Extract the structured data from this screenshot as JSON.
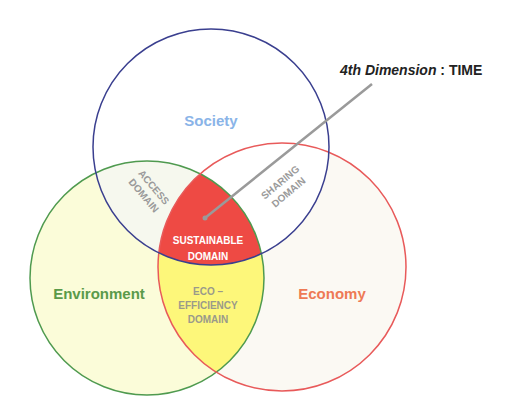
{
  "diagram": {
    "annotation": {
      "prefix": "4th Dimension",
      "separator": " : ",
      "value": "TIME"
    },
    "circles": [
      {
        "id": "society",
        "label": "Society",
        "stroke": "#3a3f8f",
        "fill": "#ffffff",
        "label_color": "#8ab4e8"
      },
      {
        "id": "environment",
        "label": "Environment",
        "stroke": "#4f9a4f",
        "fill": "#fbfcd9",
        "label_color": "#5a9a4a"
      },
      {
        "id": "economy",
        "label": "Economy",
        "stroke": "#e85a5a",
        "fill": "#fbf9f3",
        "label_color": "#ee7a55"
      }
    ],
    "intersections": {
      "access": {
        "line1": "ACCESS",
        "line2": "DOMAIN",
        "color": "#9a9a9a"
      },
      "sharing": {
        "line1": "SHARING",
        "line2": "DOMAIN",
        "color": "#9a9a9a"
      },
      "eco_efficiency": {
        "line1": "ECO –",
        "line2": "EFFICIENCY",
        "line3": "DOMAIN",
        "color": "#9a9a8a",
        "fill": "#fdf77a"
      },
      "sustainable": {
        "line1": "SUSTAINABLE",
        "line2": "DOMAIN",
        "color": "#ffffff",
        "fill": "#ee4a44"
      }
    },
    "pointer_color": "#9a9a9a"
  }
}
